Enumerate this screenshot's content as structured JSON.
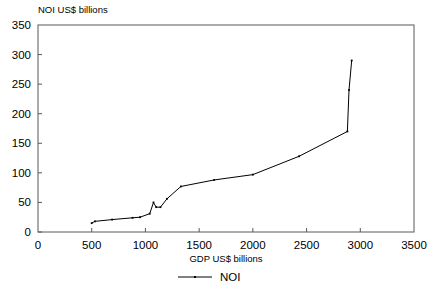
{
  "chart_data": {
    "type": "line",
    "title": "",
    "subtitle": "",
    "xlabel": "GDP US$ billions",
    "ylabel": "NOI US$ billions",
    "xlim": [
      0,
      3500
    ],
    "ylim": [
      0,
      350
    ],
    "xticks": [
      0,
      500,
      1000,
      1500,
      2000,
      2500,
      3000,
      3500
    ],
    "yticks": [
      0,
      50,
      100,
      150,
      200,
      250,
      300,
      350
    ],
    "xtick_labels": [
      "0",
      "500",
      "1000",
      "1500",
      "2000",
      "2500",
      "3000",
      "3500"
    ],
    "ytick_labels": [
      "0",
      "50",
      "100",
      "150",
      "200",
      "250",
      "300",
      "350"
    ],
    "grid": false,
    "legend_position": "bottom",
    "series": [
      {
        "name": "NOI",
        "color": "#000000",
        "marker": "small-dot",
        "points": [
          [
            500,
            15
          ],
          [
            530,
            18
          ],
          [
            690,
            21
          ],
          [
            880,
            24
          ],
          [
            950,
            25
          ],
          [
            1040,
            31
          ],
          [
            1075,
            50
          ],
          [
            1100,
            42
          ],
          [
            1140,
            42
          ],
          [
            1200,
            56
          ],
          [
            1330,
            77
          ],
          [
            1640,
            88
          ],
          [
            2000,
            97
          ],
          [
            2430,
            128
          ],
          [
            2880,
            170
          ],
          [
            2895,
            240
          ],
          [
            2920,
            290
          ]
        ]
      }
    ],
    "annotations": []
  },
  "legend": {
    "entries": [
      {
        "label": "NOI"
      }
    ]
  },
  "axis_titles": {
    "y": "NOI US$ billions",
    "x": "GDP US$ billions"
  }
}
